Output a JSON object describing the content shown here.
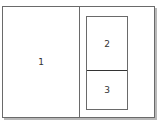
{
  "diagram": {
    "title": "",
    "panes": [
      {
        "id": "1",
        "label": "1"
      },
      {
        "id": "2",
        "label": "2"
      },
      {
        "id": "3",
        "label": "3"
      }
    ]
  }
}
